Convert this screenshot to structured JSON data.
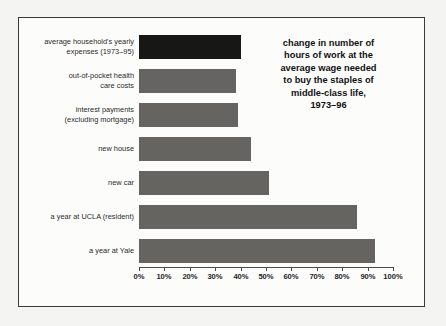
{
  "figure": {
    "background_color": "#fcfcfb",
    "border_color": "#3a3a3a",
    "page_background": "#f4f4f2"
  },
  "title": {
    "text": "change in number of\nhours of work at the\naverage wage needed\nto buy the staples of\nmiddle-class life,\n1973–96"
  },
  "chart_data": {
    "type": "bar",
    "orientation": "horizontal",
    "title": "change in number of hours of work at the average wage needed to buy the staples of middle-class life, 1973–96",
    "xlabel": "",
    "ylabel": "",
    "xlim": [
      0,
      100
    ],
    "xticks": [
      0,
      10,
      20,
      30,
      40,
      50,
      60,
      70,
      80,
      90,
      100
    ],
    "xtick_labels": [
      "0%",
      "10%",
      "20%",
      "30%",
      "40%",
      "50%",
      "60%",
      "70%",
      "80%",
      "90%",
      "100%"
    ],
    "grid": false,
    "legend": false,
    "value_unit": "%",
    "categories": [
      "average household's yearly\nexpenses (1973–95)",
      "out-of-pocket health\ncare costs",
      "interest payments\n(excluding mortgage)",
      "new house",
      "new car",
      "a year at UCLA (resident)",
      "a year at Yale"
    ],
    "values": [
      40,
      38,
      39,
      44,
      51,
      86,
      93
    ],
    "bar_colors": [
      "#171716",
      "#666461",
      "#666461",
      "#666461",
      "#666461",
      "#666461",
      "#666461"
    ],
    "highlight_index": 0,
    "series": [
      {
        "name": "change in hours of work needed, 1973–96",
        "values": [
          40,
          38,
          39,
          44,
          51,
          86,
          93
        ]
      }
    ],
    "bars": [
      {
        "label": "average household's yearly\nexpenses (1973–95)",
        "value": 40,
        "color": "#171716"
      },
      {
        "label": "out-of-pocket health\ncare costs",
        "value": 38,
        "color": "#666461"
      },
      {
        "label": "interest payments\n(excluding mortgage)",
        "value": 39,
        "color": "#666461"
      },
      {
        "label": "new house",
        "value": 44,
        "color": "#666461"
      },
      {
        "label": "new car",
        "value": 51,
        "color": "#666461"
      },
      {
        "label": "a year at UCLA (resident)",
        "value": 86,
        "color": "#666461"
      },
      {
        "label": "a year at Yale",
        "value": 93,
        "color": "#666461"
      }
    ]
  }
}
